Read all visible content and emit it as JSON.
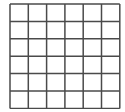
{
  "grid": {
    "rows": 6,
    "cols": 6,
    "line_color": "#4a4a4a",
    "background": "#ffffff",
    "cell_width": 18.3,
    "cell_height": 17.4,
    "line_width": 1.5
  }
}
